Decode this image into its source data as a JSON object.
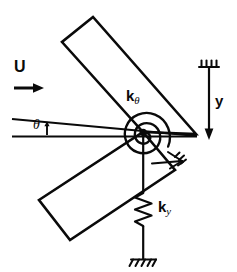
{
  "figure": {
    "kind": "mechanical-schematic",
    "background_color": "#ffffff",
    "ink_color": "#0a0a0a"
  },
  "labels": {
    "flow_speed": "U",
    "torsional_spring": {
      "base": "k",
      "subscript": "θ"
    },
    "translational_spring": {
      "base": "k",
      "subscript": "y"
    },
    "pitch_angle": "θ",
    "heave_axis": "y"
  },
  "icons": {
    "flow_arrow": "arrow-right-icon",
    "heave_arrow": "arrow-down-icon",
    "ground_top": "ground-hatch-icon",
    "ground_bottom": "ground-hatch-icon",
    "roller_support": "roller-support-icon",
    "pivot": "pivot-dot-icon",
    "torsion_spiral": "spiral-spring-icon",
    "coil_spring": "zigzag-spring-icon"
  },
  "geometry": {
    "pivot": {
      "x": 143,
      "y": 132
    },
    "apex": {
      "x": 196,
      "y": 134
    },
    "upper_plate_corners": "93,17 62,42 143,132 196,134",
    "lower_plate_corners": "70,240 39,200 143,132 175,170",
    "chord_line": {
      "x1": 12,
      "y1": 135,
      "x2": 196,
      "y2": 136
    },
    "angled_line": {
      "x1": 12,
      "y1": 120,
      "x2": 143,
      "y2": 132
    },
    "heave_axis_line": {
      "x": 209,
      "y_top": 66,
      "y_bottom": 137
    },
    "spring_axis_line": {
      "x": 143,
      "y_top": 132,
      "y_bottom": 262
    }
  }
}
